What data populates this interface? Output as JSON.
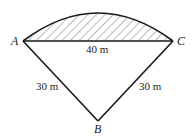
{
  "diagram": {
    "type": "circular-segment-figure",
    "vertices": {
      "A": {
        "label": "A"
      },
      "B": {
        "label": "B"
      },
      "C": {
        "label": "C"
      }
    },
    "edges": {
      "AC": {
        "label": "40 m"
      },
      "AB": {
        "label": "30 m"
      },
      "BC": {
        "label": "30 m"
      }
    },
    "shaded_region": "segment between chord AC and arc AC (hatched)",
    "colors": {
      "stroke": "#1a1a1a",
      "hatch": "#555555",
      "background": "#ffffff"
    }
  }
}
